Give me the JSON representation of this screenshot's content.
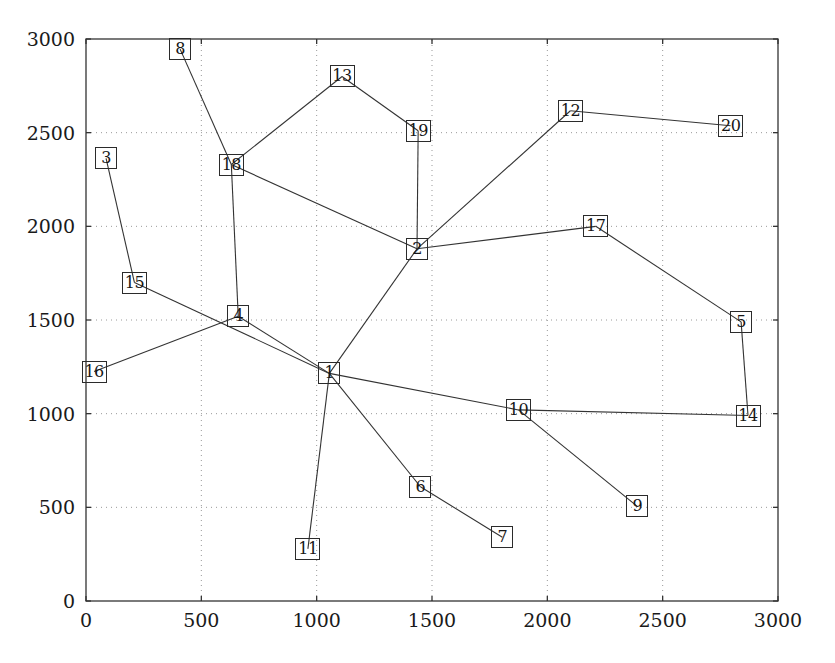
{
  "chart_data": {
    "type": "scatter",
    "title": "",
    "xlabel": "",
    "ylabel": "",
    "xlim": [
      0,
      3000
    ],
    "ylim": [
      0,
      3000
    ],
    "xticks": [
      0,
      500,
      1000,
      1500,
      2000,
      2500,
      3000
    ],
    "yticks": [
      0,
      500,
      1000,
      1500,
      2000,
      2500,
      3000
    ],
    "grid": true,
    "grid_style": "dotted",
    "legend": "none",
    "marker_style": "square-box-with-number-label",
    "line_color": "#333333",
    "axis_color": "#333333",
    "grid_color": "#999999",
    "nodes": [
      {
        "label": "1",
        "x": 1055,
        "y": 1215
      },
      {
        "label": "2",
        "x": 1435,
        "y": 1880
      },
      {
        "label": "3",
        "x": 87,
        "y": 2363
      },
      {
        "label": "4",
        "x": 660,
        "y": 1520
      },
      {
        "label": "5",
        "x": 2840,
        "y": 1490
      },
      {
        "label": "6",
        "x": 1450,
        "y": 610
      },
      {
        "label": "7",
        "x": 1805,
        "y": 340
      },
      {
        "label": "8",
        "x": 408,
        "y": 2946
      },
      {
        "label": "9",
        "x": 2390,
        "y": 505
      },
      {
        "label": "10",
        "x": 1875,
        "y": 1020
      },
      {
        "label": "11",
        "x": 962,
        "y": 278
      },
      {
        "label": "12",
        "x": 2100,
        "y": 2617
      },
      {
        "label": "13",
        "x": 1110,
        "y": 2800
      },
      {
        "label": "14",
        "x": 2870,
        "y": 990
      },
      {
        "label": "15",
        "x": 210,
        "y": 1700
      },
      {
        "label": "16",
        "x": 35,
        "y": 1225
      },
      {
        "label": "17",
        "x": 2210,
        "y": 2000
      },
      {
        "label": "18",
        "x": 630,
        "y": 2330
      },
      {
        "label": "19",
        "x": 1440,
        "y": 2510
      },
      {
        "label": "20",
        "x": 2795,
        "y": 2537
      }
    ],
    "edges": [
      {
        "from": "8",
        "to": "18"
      },
      {
        "from": "18",
        "to": "13"
      },
      {
        "from": "13",
        "to": "19"
      },
      {
        "from": "19",
        "to": "2"
      },
      {
        "from": "18",
        "to": "2"
      },
      {
        "from": "18",
        "to": "4"
      },
      {
        "from": "2",
        "to": "12"
      },
      {
        "from": "12",
        "to": "20"
      },
      {
        "from": "2",
        "to": "17"
      },
      {
        "from": "17",
        "to": "5"
      },
      {
        "from": "5",
        "to": "14"
      },
      {
        "from": "14",
        "to": "10"
      },
      {
        "from": "10",
        "to": "1"
      },
      {
        "from": "10",
        "to": "9"
      },
      {
        "from": "2",
        "to": "1"
      },
      {
        "from": "1",
        "to": "4"
      },
      {
        "from": "1",
        "to": "15"
      },
      {
        "from": "1",
        "to": "11"
      },
      {
        "from": "1",
        "to": "6"
      },
      {
        "from": "6",
        "to": "7"
      },
      {
        "from": "3",
        "to": "15"
      },
      {
        "from": "16",
        "to": "4"
      }
    ]
  },
  "axes": {
    "origin_px": {
      "x": 86,
      "y": 601
    },
    "right_px": 778,
    "top_px": 39
  }
}
